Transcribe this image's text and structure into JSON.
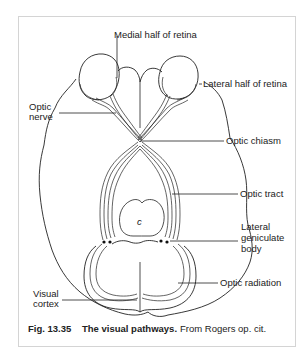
{
  "figure": {
    "labels": {
      "medial_half_retina": "Medial half of retina",
      "lateral_half_retina": "Lateral half of retina",
      "optic_nerve_1": "Optic",
      "optic_nerve_2": "nerve",
      "optic_chiasm": "Optic chiasm",
      "optic_tract": "Optic tract",
      "lgb_1": "Lateral",
      "lgb_2": "geniculate",
      "lgb_3": "body",
      "optic_radiation": "Optic radiation",
      "visual_cortex_1": "Visual",
      "visual_cortex_2": "cortex",
      "center_mark": "c"
    },
    "caption": {
      "number": "Fig. 13.35",
      "title": "The visual pathways.",
      "source": "From Rogers op. cit."
    }
  }
}
